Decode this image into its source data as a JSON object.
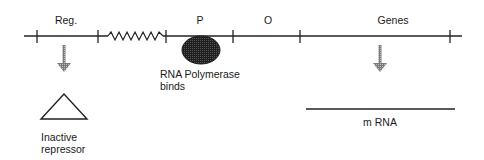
{
  "diagram": {
    "title": "",
    "regions": [
      {
        "id": "reg",
        "label": "Reg."
      },
      {
        "id": "promoter",
        "label": "P"
      },
      {
        "id": "operator",
        "label": "O"
      },
      {
        "id": "genes",
        "label": "Genes"
      }
    ],
    "polymerase_label_line1": "RNA  Polymerase",
    "polymerase_label_line2": "binds",
    "repressor_label_line1": "Inactive",
    "repressor_label_line2": "repressor",
    "mrna_label": "m  RNA",
    "colors": {
      "line": "#222222",
      "polymerase_fill": "#2b2b2b",
      "arrow": "#8a8a8a"
    }
  }
}
